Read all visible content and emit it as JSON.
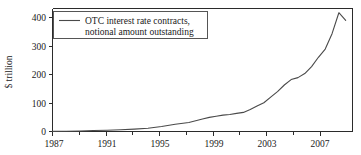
{
  "chart_data": {
    "type": "line",
    "title": "",
    "xlabel": "",
    "ylabel": "$ trillion",
    "xlim": [
      1987,
      2009
    ],
    "ylim": [
      0,
      435
    ],
    "grid": false,
    "legend_position": "top-left",
    "legend_entries": [
      {
        "name": "OTC interest rate contracts, notional amount outstanding",
        "line1": "OTC interest rate contracts,",
        "line2": "notional amount outstanding",
        "color": "#4a4a4a"
      }
    ],
    "x_tick_labels": [
      "1987",
      "1991",
      "1995",
      "1999",
      "2003",
      "2007"
    ],
    "x_tick_values": [
      1987,
      1991,
      1995,
      1999,
      2003,
      2007
    ],
    "x_minor_tick_values": [
      1989,
      1993,
      1997,
      2001,
      2005
    ],
    "y_tick_labels": [
      "0",
      "100",
      "200",
      "300",
      "400"
    ],
    "y_tick_values": [
      0,
      100,
      200,
      300,
      400
    ],
    "series": [
      {
        "name": "OTC interest rate contracts, notional amount outstanding",
        "color": "#4a4a4a",
        "x": [
          1987,
          1988,
          1989,
          1990,
          1991,
          1992,
          1993,
          1994,
          1995,
          1996,
          1997,
          1998,
          1998.5,
          1999,
          1999.5,
          2000,
          2000.5,
          2001,
          2001.5,
          2002,
          2002.5,
          2003,
          2003.5,
          2004,
          2004.5,
          2005,
          2005.5,
          2006,
          2006.5,
          2007,
          2007.5,
          2008,
          2008.5
        ],
        "values": [
          0.4,
          1.0,
          1.9,
          3.5,
          4.4,
          6.0,
          8.5,
          11.3,
          17.7,
          25.5,
          32.0,
          44.0,
          50.0,
          54.1,
          58.0,
          60.1,
          64.1,
          67.5,
          77.5,
          89.9,
          101.7,
          121.8,
          141.0,
          164.5,
          183.6,
          190.5,
          204.8,
          229.2,
          262.5,
          291.6,
          346.0,
          420.0,
          393.1
        ],
        "annotations": []
      }
    ],
    "series_dip": {
      "note": "peak near 2007.6 at about 420, dips to about 355, recovers to about 400"
    }
  },
  "figure": {
    "background_color": "#ffffff",
    "line_color": "#4a4a4a",
    "axis_color": "#2b2b2b",
    "text_color": "#1a1a1a"
  }
}
